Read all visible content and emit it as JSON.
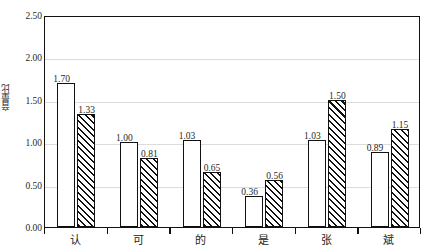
{
  "chart_data": {
    "type": "bar",
    "title": "",
    "subtitle": "",
    "xlabel": "",
    "ylabel": "音量比",
    "categories": [
      "认",
      "可",
      "的",
      "是",
      "张",
      "斌"
    ],
    "series": [
      {
        "name": "series-1",
        "style": "white-outline",
        "values": [
          1.7,
          1.0,
          1.03,
          0.36,
          1.03,
          0.89
        ]
      },
      {
        "name": "series-2",
        "style": "diagonal-hatch",
        "values": [
          1.33,
          0.81,
          0.65,
          0.56,
          1.5,
          1.15
        ]
      }
    ],
    "value_labels": [
      [
        "1.70",
        "1.33"
      ],
      [
        "1.00",
        "0.81"
      ],
      [
        "1.03",
        "0.65"
      ],
      [
        "0.36",
        "0.56"
      ],
      [
        "1.03",
        "1.50"
      ],
      [
        "0.89",
        "1.15"
      ]
    ],
    "ylim": [
      0.0,
      2.5
    ],
    "ytick_values": [
      0.0,
      0.5,
      1.0,
      1.5,
      2.0,
      2.5
    ],
    "ytick_labels": [
      "0.00",
      "0.50",
      "1.00",
      "1.50",
      "2.00",
      "2.50"
    ],
    "grid": true,
    "grid_axis": "y",
    "legend": false,
    "legend_position": "none",
    "frame": true,
    "colors": {
      "axis": "#111111",
      "grid": "#dcdcdc",
      "bar_fill": "#ffffff",
      "bar_edge": "#111111",
      "hatch": "#111111",
      "text": "#1f1f1f",
      "background": "#ffffff"
    }
  }
}
